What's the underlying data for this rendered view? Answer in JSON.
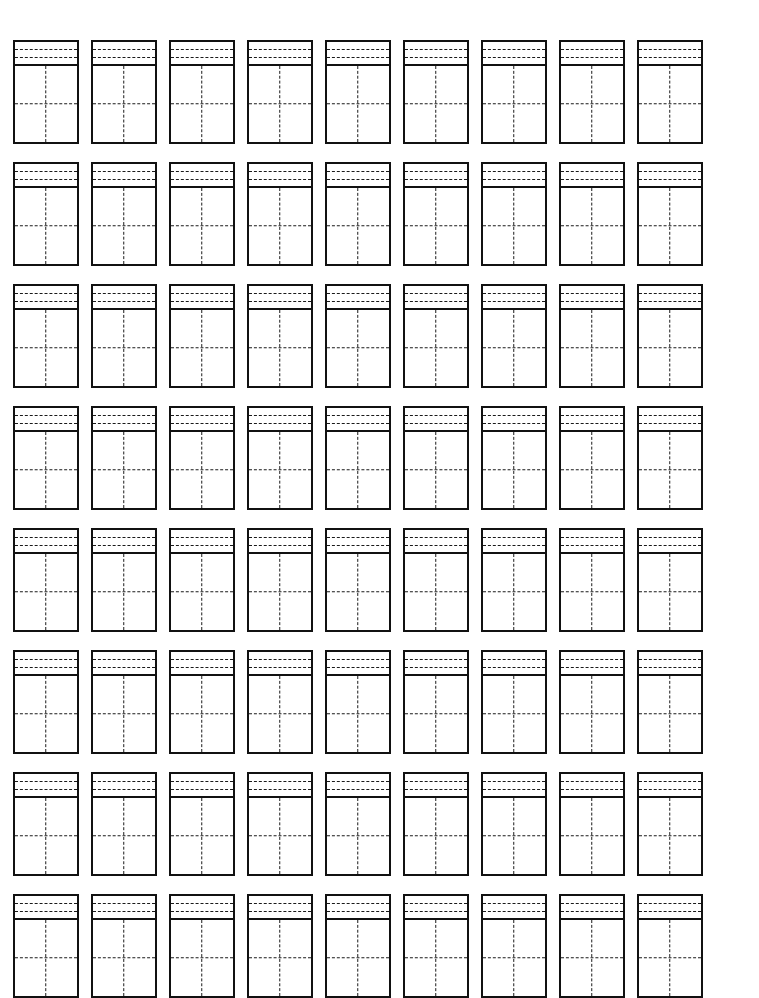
{
  "worksheet": {
    "title": "Character Practice Grid Worksheet",
    "page_background": "#ffffff",
    "ink_color": "#111111",
    "guide_color": "#1a1a1a",
    "rows": 8,
    "columns": 9,
    "total_cells": 72,
    "cell": {
      "pinyin_band": {
        "guide_lines": 2,
        "guide_style": "dashed"
      },
      "character_square": {
        "guides": [
          "vertical-center",
          "horizontal-center"
        ],
        "guide_style": "dashed"
      },
      "border_style": "solid",
      "content": ""
    },
    "grid": [
      {
        "row_index": 1,
        "cells": [
          "",
          "",
          "",
          "",
          "",
          "",
          "",
          "",
          ""
        ]
      },
      {
        "row_index": 2,
        "cells": [
          "",
          "",
          "",
          "",
          "",
          "",
          "",
          "",
          ""
        ]
      },
      {
        "row_index": 3,
        "cells": [
          "",
          "",
          "",
          "",
          "",
          "",
          "",
          "",
          ""
        ]
      },
      {
        "row_index": 4,
        "cells": [
          "",
          "",
          "",
          "",
          "",
          "",
          "",
          "",
          ""
        ]
      },
      {
        "row_index": 5,
        "cells": [
          "",
          "",
          "",
          "",
          "",
          "",
          "",
          "",
          ""
        ]
      },
      {
        "row_index": 6,
        "cells": [
          "",
          "",
          "",
          "",
          "",
          "",
          "",
          "",
          ""
        ]
      },
      {
        "row_index": 7,
        "cells": [
          "",
          "",
          "",
          "",
          "",
          "",
          "",
          "",
          ""
        ]
      },
      {
        "row_index": 8,
        "cells": [
          "",
          "",
          "",
          "",
          "",
          "",
          "",
          "",
          ""
        ]
      }
    ]
  }
}
